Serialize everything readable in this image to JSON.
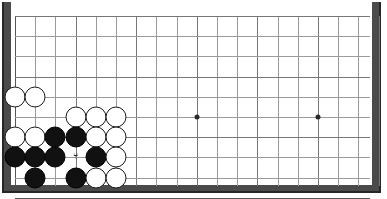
{
  "board": {
    "name": "go-board",
    "game": "Go",
    "view": "bottom-left-corner-crop",
    "visible_columns": 19,
    "visible_rows": 10,
    "grid_spacing_px": 20.2,
    "origin_x_px": 15,
    "origin_y_px": 16,
    "colors": {
      "background": "#ffffff",
      "grid_line": "#9a9a9a",
      "edge_line": "#555555",
      "border": "#4a4a4a",
      "border_dark": "#262626",
      "black_stone": "#111111",
      "white_stone": "#ffffff",
      "stone_outline": "#1a1a1a",
      "hoshi": "#2a2a2a"
    }
  },
  "hoshi_points": [
    {
      "name": "star-point-1",
      "col": 9,
      "row": 5
    },
    {
      "name": "star-point-2",
      "col": 15,
      "row": 5
    }
  ],
  "markers": [
    {
      "name": "last-move-marker",
      "col": 3,
      "row": 7,
      "glyph": "⑂"
    }
  ],
  "stones": [
    {
      "color": "white",
      "col": 0,
      "row": 4
    },
    {
      "color": "white",
      "col": 1,
      "row": 4
    },
    {
      "color": "white",
      "col": 3,
      "row": 5
    },
    {
      "color": "white",
      "col": 4,
      "row": 5
    },
    {
      "color": "white",
      "col": 5,
      "row": 5
    },
    {
      "color": "white",
      "col": 0,
      "row": 6
    },
    {
      "color": "white",
      "col": 1,
      "row": 6
    },
    {
      "color": "black",
      "col": 2,
      "row": 6
    },
    {
      "color": "black",
      "col": 3,
      "row": 6
    },
    {
      "color": "white",
      "col": 4,
      "row": 6
    },
    {
      "color": "white",
      "col": 5,
      "row": 6
    },
    {
      "color": "black",
      "col": 0,
      "row": 7
    },
    {
      "color": "black",
      "col": 1,
      "row": 7
    },
    {
      "color": "black",
      "col": 2,
      "row": 7
    },
    {
      "color": "black",
      "col": 4,
      "row": 7
    },
    {
      "color": "white",
      "col": 5,
      "row": 7
    },
    {
      "color": "black",
      "col": 1,
      "row": 8
    },
    {
      "color": "black",
      "col": 3,
      "row": 8
    },
    {
      "color": "white",
      "col": 4,
      "row": 8
    },
    {
      "color": "white",
      "col": 5,
      "row": 8
    }
  ],
  "grid": {
    "vertical_line_count": 19,
    "horizontal_line_count": 9
  }
}
